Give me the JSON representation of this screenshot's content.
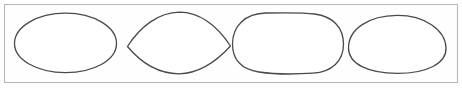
{
  "figure": {
    "background_color": "#fefefe",
    "width": 462,
    "height": 88,
    "frame": {
      "name": "bounding-frame",
      "x": 4.5,
      "y": 4.5,
      "width": 453,
      "height": 78,
      "stroke_color": "#b4b4b4",
      "stroke_width": 1,
      "fill_color": "#fefefe"
    },
    "stroke_color": "#4a4a4a",
    "stroke_width": 1.3,
    "shapes": [
      {
        "index": 1,
        "name": "wide-ellipse",
        "label": "ellipse",
        "description": "Wide smooth ellipse, horizontal major axis",
        "center_x": 65,
        "center_y": 43,
        "radius_x": 51,
        "radius_y": 29,
        "path": "M 14.5 43.5 C 14.5 27.0 37.0 13.2 65.5 13.2 C 94.0 13.2 116.5 27.0 116.5 43.5 C 116.5 60.0 94.0 72.6 65.5 72.6 C 37.5 72.6 14.5 60.0 14.5 43.5 Z"
      },
      {
        "index": 2,
        "name": "lens-shape",
        "label": "lens",
        "description": "Lens or eye shape with pointed cusps at left and right",
        "center_x": 179,
        "center_y": 43,
        "radius_x": 52,
        "radius_y": 31,
        "path": "M 127.5 46.5 C 140.0 27.0 158.0 12.5 179.5 12.2 C 201.0 12.5 218.5 28.0 230.5 46.0 C 214.0 64.0 198.0 73.6 179.0 73.8 C 159.5 73.6 142.0 64.0 127.5 46.5 Z"
      },
      {
        "index": 3,
        "name": "rounded-rectangle-shape",
        "label": "rounded rectangle",
        "description": "Stadium-like rounded rectangle with broad flat top and bottom",
        "center_x": 288,
        "center_y": 43,
        "radius_x": 56,
        "radius_y": 31,
        "path": "M 232.5 44.0 C 232.5 26.0 245.0 13.5 266.0 13.0 C 286.0 12.6 306.0 12.8 314.5 14.0 C 333.5 16.5 343.5 28.0 343.5 44.0 C 343.5 61.0 332.0 72.0 313.0 73.2 C 294.0 74.4 272.0 74.0 259.0 72.0 C 241.0 69.2 232.5 60.0 232.5 44.0 Z"
      },
      {
        "index": 4,
        "name": "egg-oval-shape",
        "label": "oval",
        "description": "Egg-shaped oval, narrower arched top and wider flatter bottom",
        "center_x": 397,
        "center_y": 45,
        "radius_x": 49,
        "radius_y": 28,
        "path": "M 348.5 48.0 C 348.5 29.0 369.0 15.6 397.0 15.4 C 424.0 15.2 445.5 29.5 446.0 48.0 C 446.5 63.5 427.0 73.4 397.5 73.4 C 368.0 73.4 348.5 64.0 348.5 48.0 Z"
      }
    ]
  }
}
